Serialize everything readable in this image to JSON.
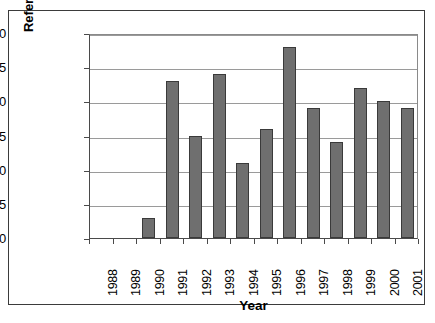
{
  "chart_data": {
    "type": "bar",
    "title": "",
    "xlabel": "Year",
    "ylabel": "References",
    "categories": [
      "1988",
      "1989",
      "1990",
      "1991",
      "1992",
      "1993",
      "1994",
      "1995",
      "1996",
      "1997",
      "1998",
      "1999",
      "2000",
      "2001"
    ],
    "values": [
      0,
      0,
      3,
      23,
      15,
      24,
      11,
      16,
      28,
      19,
      14,
      22,
      20,
      19
    ],
    "ylim": [
      0,
      30
    ],
    "ytick_values": [
      0,
      5,
      10,
      15,
      20,
      25,
      30
    ],
    "ytick_labels": [
      "0",
      "5",
      "10",
      "15",
      "20",
      "25",
      "30"
    ],
    "grid": "horizontal",
    "legend": "none",
    "bar_color": "#6f6f6f",
    "bar_border_color": "#3a3a3a",
    "gridline_color": "#9a9a9a",
    "axis_color": "#4a4a4a",
    "frame_color": "#3b3b3b",
    "background": "#ffffff",
    "xtick_rotation": -90
  },
  "caption": {
    "text": ""
  }
}
